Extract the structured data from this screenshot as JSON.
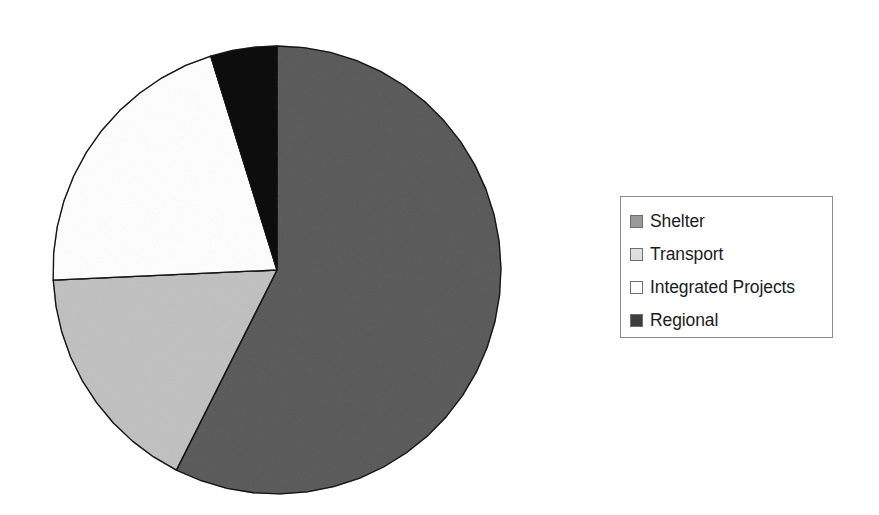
{
  "chart_data": {
    "type": "pie",
    "title": "",
    "subtitle": "",
    "xlabel": "",
    "ylabel": "",
    "grid": false,
    "legend_position": "right",
    "start_angle_deg": 90,
    "direction": "counterclockwise",
    "categories": [
      "Shelter",
      "Transport",
      "Integrated Projects",
      "Regional"
    ],
    "values": [
      57.5,
      16.8,
      21.0,
      4.7
    ],
    "units": "percent",
    "slices": [
      {
        "label": "Shelter",
        "value": 57.5,
        "color": "#999999",
        "start_angle_deg": 153.3,
        "end_angle_deg": 360.0,
        "sweep_deg": 206.7
      },
      {
        "label": "Transport",
        "value": 16.8,
        "color": "#dedede",
        "start_angle_deg": 92.6,
        "end_angle_deg": 153.3,
        "sweep_deg": 60.7
      },
      {
        "label": "Integrated Projects",
        "value": 21.0,
        "color": "#ffffff",
        "start_angle_deg": 17.2,
        "end_angle_deg": 92.6,
        "sweep_deg": 75.4
      },
      {
        "label": "Regional",
        "value": 4.7,
        "color": "#3d3d3d",
        "start_angle_deg": 0.0,
        "end_angle_deg": 17.2,
        "sweep_deg": 17.2
      }
    ],
    "geometry": {
      "center_x": 277,
      "center_y": 270,
      "radius": 224,
      "outline_color": "#4a4a4a"
    }
  },
  "legend": {
    "border_color": "#8d8d8d",
    "background": "#ffffff",
    "items": [
      {
        "label": "Shelter",
        "color": "#999999",
        "swatch_name": "legend-swatch-shelter"
      },
      {
        "label": "Transport",
        "color": "#dedede",
        "swatch_name": "legend-swatch-transport"
      },
      {
        "label": "Integrated Projects",
        "color": "#ffffff",
        "swatch_name": "legend-swatch-integrated-projects"
      },
      {
        "label": "Regional",
        "color": "#3d3d3d",
        "swatch_name": "legend-swatch-regional"
      }
    ]
  }
}
